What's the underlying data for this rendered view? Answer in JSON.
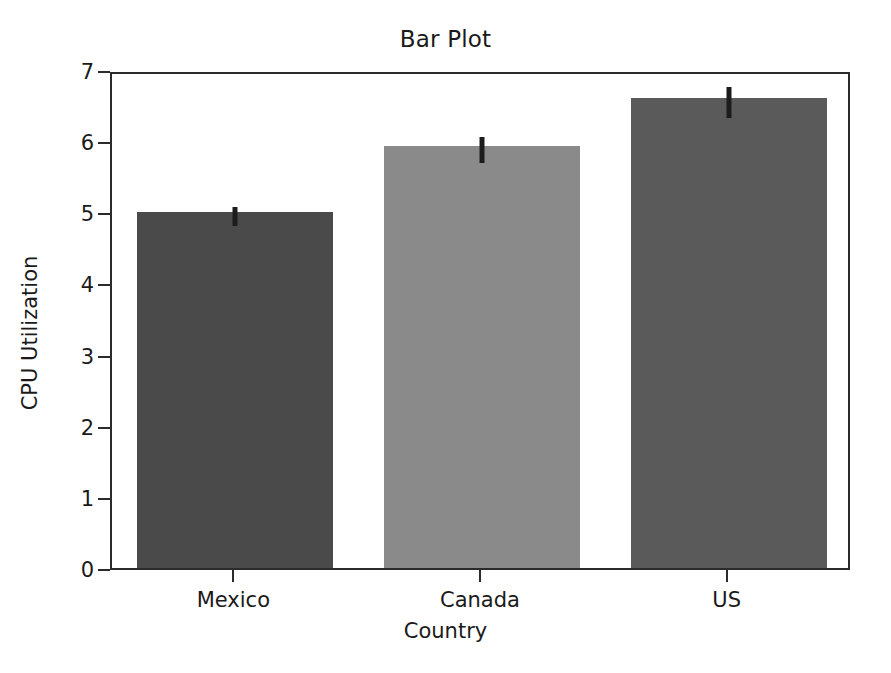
{
  "chart_data": {
    "type": "bar",
    "title": "Bar Plot",
    "xlabel": "Country",
    "ylabel": "CPU Utilization",
    "categories": [
      "Mexico",
      "Canada",
      "US"
    ],
    "values": [
      5.0,
      5.93,
      6.6
    ],
    "errors": [
      0.13,
      0.18,
      0.22
    ],
    "bar_colors": [
      "#4a4a4a",
      "#8a8a8a",
      "#5a5a5a"
    ],
    "ylim": [
      0,
      7
    ],
    "yticks": [
      0,
      1,
      2,
      3,
      4,
      5,
      6,
      7
    ],
    "ytick_labels": [
      "0",
      "1",
      "2",
      "3",
      "4",
      "5",
      "6",
      "7"
    ],
    "grid": false,
    "legend": null,
    "error_bar_color": "#1c1c1c",
    "axis_color": "#2b2b2b",
    "background": "#ffffff"
  }
}
